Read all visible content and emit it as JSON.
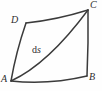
{
  "figure": {
    "type": "geometry-diagram",
    "background_color": "#fefefe",
    "stroke_color": "#3b3b3b",
    "text_color": "#2e2e2e",
    "vertices": [
      {
        "id": "A",
        "label": "A",
        "x": 11,
        "y": 81,
        "label_x": 1,
        "label_y": 74
      },
      {
        "id": "B",
        "label": "B",
        "x": 87,
        "y": 76,
        "label_x": 89,
        "label_y": 72
      },
      {
        "id": "C",
        "label": "C",
        "x": 88,
        "y": 10,
        "label_x": 90,
        "label_y": 0
      },
      {
        "id": "D",
        "label": "D",
        "x": 26,
        "y": 23,
        "label_x": 11,
        "label_y": 15
      }
    ],
    "edges": [
      {
        "id": "AB",
        "from": "A",
        "to": "B",
        "path": "M 11 81 Q 49 85 87 76"
      },
      {
        "id": "BC",
        "from": "B",
        "to": "C",
        "path": "M 87 76 Q 88.5 43 88 10"
      },
      {
        "id": "CD",
        "from": "C",
        "to": "D",
        "path": "M 88 10 Q 56 20 26 23"
      },
      {
        "id": "DA",
        "from": "D",
        "to": "A",
        "path": "M 26 23 Q 16 52 11 81"
      }
    ],
    "diagonal": {
      "id": "AC",
      "from": "A",
      "to": "C",
      "path": "M 11 81 Q 48 64 88 10",
      "label": {
        "prefix": "d",
        "variable": "s",
        "text": "ds",
        "x": 32,
        "y": 44
      }
    }
  }
}
